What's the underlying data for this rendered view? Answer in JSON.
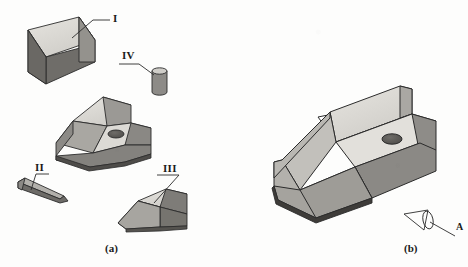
{
  "figure": {
    "title": "",
    "captions": {
      "exploded": "(a)",
      "assembled": "(b)"
    },
    "view_arrow_label": "A"
  },
  "parts": [
    {
      "id": "I",
      "label": "I",
      "name": "wedge-block",
      "description": "rectangular block with angled front face",
      "leader": true
    },
    {
      "id": "II",
      "label": "II",
      "name": "thin-taper-key",
      "description": "thin elongated tapered plate",
      "leader": true
    },
    {
      "id": "III",
      "label": "III",
      "name": "trapezoid-wedge",
      "description": "trapezoidal wedge block",
      "leader": true
    },
    {
      "id": "IV",
      "label": "IV",
      "name": "cylindrical-pin",
      "description": "short cylindrical pin",
      "leader": true
    }
  ],
  "base_part": {
    "name": "stepped-base-with-hole",
    "description": "stepped base block with inclined upper face and through hole",
    "hole_count": 1
  },
  "assembly": {
    "name": "assembled-body",
    "description": "assembled stepped block with inclined face and through hole",
    "hole_count": 1
  },
  "colors": {
    "background": "#fdfdfc",
    "face_top_light": "#d8d6d1",
    "face_top_lighter": "#e4e2dd",
    "face_side_mid": "#b0aea9",
    "face_side_dark": "#8c8a86",
    "face_side_darkest": "#6f6d69",
    "outline": "#2b2b2b",
    "hole": "#5a5855",
    "leader_line": "#2b2b2b",
    "text": "#1a1a1a"
  }
}
